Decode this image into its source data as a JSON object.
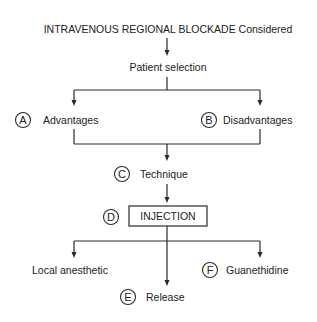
{
  "diagram": {
    "type": "flowchart",
    "colors": {
      "stroke": "#2a2a2a",
      "text": "#222222",
      "background": "#ffffff"
    },
    "title": "INTRAVENOUS REGIONAL BLOCKADE Considered",
    "patient_selection": "Patient selection",
    "advantages": {
      "letter": "A",
      "label": "Advantages"
    },
    "disadvantages": {
      "letter": "B",
      "label": "Disadvantages"
    },
    "technique": {
      "letter": "C",
      "label": "Technique"
    },
    "injection": {
      "letter": "D",
      "label": "INJECTION"
    },
    "local_anesthetic": {
      "label": "Local anesthetic"
    },
    "release": {
      "letter": "E",
      "label": "Release"
    },
    "guanethidine": {
      "letter": "F",
      "label": "Guanethidine"
    }
  }
}
